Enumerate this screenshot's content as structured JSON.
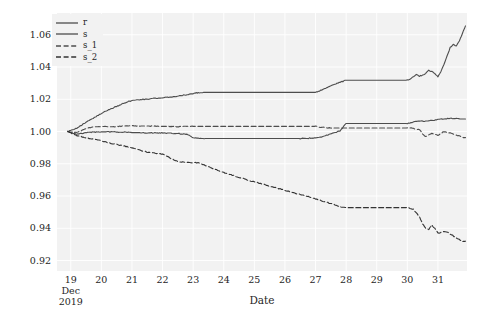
{
  "chart_data": {
    "type": "line",
    "title": "",
    "xlabel": "Date",
    "ylabel": "",
    "grid": true,
    "grid_color": "#ffffff",
    "plot_background": "#f2f2f2",
    "figure_background": "#ffffff",
    "legend_position": "upper left",
    "ylim": [
      0.9135,
      1.0735
    ],
    "yticks": [
      1.06,
      1.04,
      1.02,
      1.0,
      0.98,
      0.96,
      0.94,
      0.92
    ],
    "ytick_labels": [
      "1.06",
      "1.04",
      "1.02",
      "1.00",
      "0.98",
      "0.96",
      "0.94",
      "0.92"
    ],
    "xlim": [
      "2019-12-18.55",
      "2019-12-31.95"
    ],
    "xticks": [
      "19",
      "20",
      "21",
      "22",
      "23",
      "24",
      "25",
      "26",
      "27",
      "28",
      "29",
      "30",
      "31"
    ],
    "xtick_sublabels": [
      "Dec\n2019",
      "",
      "",
      "",
      "",
      "",
      "",
      "",
      "",
      "",
      "",
      "",
      ""
    ],
    "x_axis_origin_month": "Dec",
    "x_axis_origin_year": "2019",
    "series": [
      {
        "name": "r",
        "style": "solid",
        "color": "#4d4d4d",
        "linewidth": 1.1,
        "x": [
          18.9,
          19.0,
          19.1,
          19.2,
          19.3,
          19.4,
          19.5,
          19.6,
          19.7,
          19.8,
          19.9,
          20.0,
          20.1,
          20.2,
          20.3,
          20.4,
          20.5,
          20.6,
          20.7,
          20.8,
          20.9,
          21.0,
          21.2,
          21.4,
          21.6,
          21.8,
          22.0,
          22.2,
          22.4,
          22.6,
          22.8,
          23.0,
          23.1,
          23.2,
          23.3,
          23.4,
          23.5,
          23.6,
          23.7,
          23.8,
          23.9,
          24.0,
          24.2,
          24.4,
          24.6,
          24.8,
          25.0,
          25.2,
          25.4,
          25.6,
          25.8,
          26.0,
          26.2,
          26.4,
          26.6,
          26.8,
          27.0,
          27.1,
          27.2,
          27.3,
          27.4,
          27.5,
          27.6,
          27.7,
          27.8,
          27.9,
          28.0,
          28.3,
          28.6,
          28.9,
          29.2,
          29.5,
          29.8,
          30.0,
          30.1,
          30.2,
          30.3,
          30.4,
          30.5,
          30.6,
          30.7,
          30.8,
          30.9,
          31.0,
          31.1,
          31.2,
          31.3,
          31.4,
          31.5,
          31.6,
          31.7,
          31.8,
          31.9
        ],
        "y": [
          1.0,
          1.0006,
          1.0012,
          1.002,
          1.0033,
          1.0046,
          1.0058,
          1.007,
          1.0079,
          1.0091,
          1.01,
          1.0112,
          1.0122,
          1.0132,
          1.014,
          1.0148,
          1.0157,
          1.0163,
          1.0172,
          1.018,
          1.0188,
          1.0192,
          1.0196,
          1.02,
          1.0203,
          1.0206,
          1.0209,
          1.0213,
          1.0217,
          1.0222,
          1.0228,
          1.0236,
          1.0239,
          1.0241,
          1.0242,
          1.0243,
          1.0243,
          1.0243,
          1.0243,
          1.0243,
          1.0243,
          1.0243,
          1.0243,
          1.0243,
          1.0243,
          1.0243,
          1.0243,
          1.0243,
          1.0243,
          1.0243,
          1.0243,
          1.0243,
          1.0243,
          1.0243,
          1.0243,
          1.0243,
          1.0243,
          1.025,
          1.0258,
          1.0266,
          1.0275,
          1.0283,
          1.029,
          1.0298,
          1.0305,
          1.0312,
          1.0318,
          1.0318,
          1.0318,
          1.0318,
          1.0318,
          1.0318,
          1.0318,
          1.0318,
          1.0326,
          1.034,
          1.0352,
          1.0344,
          1.035,
          1.0362,
          1.038,
          1.0372,
          1.0358,
          1.034,
          1.0372,
          1.042,
          1.047,
          1.052,
          1.054,
          1.053,
          1.056,
          1.061,
          1.0655
        ],
        "final_value": 1.0655
      },
      {
        "name": "s",
        "style": "solid",
        "color": "#4d4d4d",
        "linewidth": 1.1,
        "x": [
          18.9,
          19.0,
          19.1,
          19.2,
          19.3,
          19.4,
          19.5,
          19.6,
          19.7,
          19.8,
          20.0,
          20.2,
          20.4,
          20.6,
          20.8,
          21.0,
          21.3,
          21.6,
          21.9,
          22.2,
          22.5,
          22.8,
          23.0,
          23.2,
          23.4,
          23.6,
          23.8,
          24.0,
          24.5,
          25.0,
          25.5,
          26.0,
          26.5,
          27.0,
          27.2,
          27.4,
          27.6,
          27.8,
          28.0,
          28.5,
          29.0,
          29.5,
          30.0,
          30.2,
          30.4,
          30.6,
          30.8,
          31.0,
          31.2,
          31.4,
          31.6,
          31.8,
          31.9
        ],
        "y": [
          1.0,
          0.9994,
          0.9988,
          0.9984,
          0.9988,
          0.999,
          0.9993,
          0.9994,
          0.9996,
          0.9997,
          0.9998,
          0.9998,
          0.9997,
          0.9996,
          0.9995,
          0.9993,
          0.9993,
          0.9992,
          0.9991,
          0.999,
          0.9988,
          0.9982,
          0.9962,
          0.9958,
          0.9957,
          0.9957,
          0.9957,
          0.9957,
          0.9957,
          0.9957,
          0.9957,
          0.9957,
          0.9957,
          0.996,
          0.9968,
          0.9978,
          0.999,
          1.0004,
          1.005,
          1.005,
          1.005,
          1.005,
          1.005,
          1.0058,
          1.0066,
          1.0064,
          1.0068,
          1.0074,
          1.0078,
          1.0082,
          1.008,
          1.0078,
          1.0078
        ],
        "final_value": 1.0078
      },
      {
        "name": "s_1",
        "style": "dashed",
        "color": "#4d4d4d",
        "linewidth": 1.1,
        "x": [
          18.9,
          19.0,
          19.1,
          19.2,
          19.3,
          19.4,
          19.5,
          19.6,
          19.8,
          20.0,
          20.2,
          20.4,
          20.6,
          20.8,
          21.0,
          21.3,
          21.6,
          21.9,
          22.2,
          22.5,
          22.8,
          23.0,
          23.5,
          24.0,
          24.5,
          25.0,
          25.5,
          26.0,
          26.5,
          27.0,
          27.3,
          27.6,
          27.9,
          28.0,
          28.5,
          29.0,
          29.5,
          30.0,
          30.2,
          30.4,
          30.5,
          30.6,
          30.8,
          31.0,
          31.2,
          31.4,
          31.6,
          31.8,
          31.9
        ],
        "y": [
          1.0,
          0.9996,
          0.9993,
          0.9996,
          1.0002,
          1.001,
          1.0018,
          1.0024,
          1.0029,
          1.0031,
          1.003,
          1.003,
          1.0032,
          1.0034,
          1.0036,
          1.0034,
          1.0034,
          1.0032,
          1.0032,
          1.003,
          1.0031,
          1.0032,
          1.0032,
          1.0032,
          1.0032,
          1.0032,
          1.0032,
          1.0032,
          1.0032,
          1.0032,
          1.0024,
          1.0022,
          1.0022,
          1.0022,
          1.0022,
          1.0022,
          1.0022,
          1.0022,
          1.002,
          1.001,
          0.9986,
          0.9968,
          0.999,
          0.9976,
          1.0,
          0.999,
          0.9978,
          0.9964,
          0.9962
        ],
        "final_value": 0.9962
      },
      {
        "name": "s_2",
        "style": "dashed",
        "color": "#333333",
        "linewidth": 1.1,
        "x": [
          18.9,
          19.0,
          19.1,
          19.2,
          19.3,
          19.4,
          19.5,
          19.6,
          19.8,
          20.0,
          20.2,
          20.4,
          20.6,
          20.8,
          21.0,
          21.2,
          21.4,
          21.6,
          21.8,
          22.0,
          22.5,
          23.0,
          23.2,
          23.4,
          23.6,
          23.8,
          24.0,
          24.4,
          24.8,
          25.2,
          25.6,
          26.0,
          26.4,
          26.8,
          27.2,
          27.6,
          27.9,
          28.0,
          28.5,
          29.0,
          29.5,
          30.0,
          30.2,
          30.4,
          30.5,
          30.6,
          30.7,
          30.8,
          30.9,
          31.0,
          31.2,
          31.4,
          31.6,
          31.8,
          31.9
        ],
        "y": [
          1.0,
          0.9992,
          0.9982,
          0.9974,
          0.997,
          0.9966,
          0.9962,
          0.9958,
          0.995,
          0.9942,
          0.9932,
          0.9924,
          0.9916,
          0.9908,
          0.99,
          0.9888,
          0.9876,
          0.987,
          0.9864,
          0.986,
          0.9812,
          0.9808,
          0.9806,
          0.979,
          0.9774,
          0.976,
          0.9746,
          0.9722,
          0.9698,
          0.9678,
          0.9656,
          0.9636,
          0.9614,
          0.9594,
          0.957,
          0.9548,
          0.953,
          0.9528,
          0.9528,
          0.9528,
          0.9528,
          0.9528,
          0.9518,
          0.947,
          0.9428,
          0.94,
          0.9392,
          0.942,
          0.9398,
          0.937,
          0.9382,
          0.9366,
          0.934,
          0.9318,
          0.932
        ],
        "final_value": 0.932
      }
    ]
  },
  "legend": {
    "items": [
      {
        "label": "r",
        "style": "solid"
      },
      {
        "label": "s",
        "style": "solid"
      },
      {
        "label": "s_1",
        "style": "dashed"
      },
      {
        "label": "s_2",
        "style": "dashed"
      }
    ]
  },
  "axes": {
    "x_title": "Date",
    "y_title": ""
  }
}
